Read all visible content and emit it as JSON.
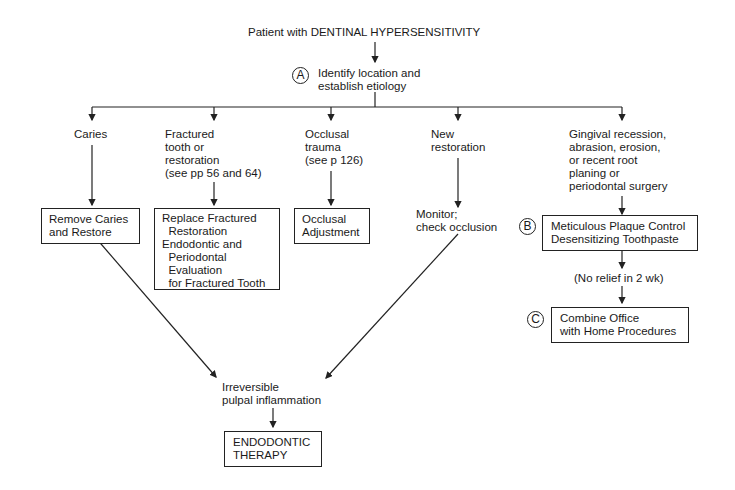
{
  "title": "Patient with DENTINAL HYPERSENSITIVITY",
  "step_a": {
    "marker": "A",
    "text": "Identify location and\nestablish etiology"
  },
  "branches": [
    {
      "label": "Caries",
      "action": "Remove Caries\nand Restore"
    },
    {
      "label": "Fractured\ntooth or\nrestoration\n(see pp 56 and 64)",
      "action": "Replace Fractured\n  Restoration\nEndodontic and\n  Periodontal\n  Evaluation\n  for Fractured Tooth"
    },
    {
      "label": "Occlusal\ntrauma\n(see p 126)",
      "action": "Occlusal\nAdjustment"
    },
    {
      "label": "New\nrestoration",
      "action": "Monitor;\ncheck occlusion"
    },
    {
      "label": "Gingival recession,\nabrasion, erosion,\nor recent root\nplaning or\nperiodontal surgery",
      "action": "Meticulous Plaque Control\nDesensitizing Toothpaste"
    }
  ],
  "step_b": {
    "marker": "B"
  },
  "no_relief": "(No relief in 2 wk)",
  "step_c": {
    "marker": "C",
    "text": "Combine Office\nwith Home Procedures"
  },
  "pulpal": "Irreversible\npulpal inflammation",
  "endo": "ENDODONTIC\nTHERAPY"
}
